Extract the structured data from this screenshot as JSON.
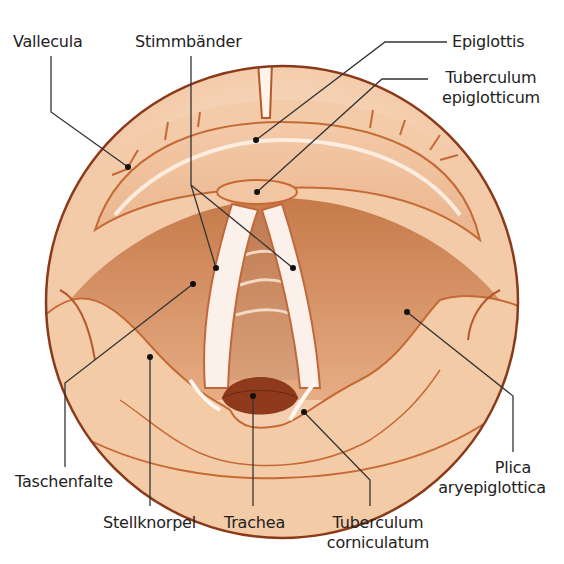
{
  "diagram": {
    "colors": {
      "background": "#ffffff",
      "tissue_light": "#f6d2b4",
      "tissue_mid": "#eab28a",
      "tissue_dark": "#c9733f",
      "outline": "#8a3a18",
      "cord_white": "#fbf1ea",
      "trachea_dark": "#8f3a1c",
      "leader_line": "#333333"
    },
    "labels": {
      "vallecula": "Vallecula",
      "stimmbaender": "Stimmbänder",
      "epiglottis": "Epiglottis",
      "tuberculum_epiglotticum_1": "Tuberculum",
      "tuberculum_epiglotticum_2": "epiglotticum",
      "taschenfalte": "Taschenfalte",
      "plica_1": "Plica",
      "plica_2": "aryepiglottica",
      "stellknorpel": "Stellknorpel",
      "trachea": "Trachea",
      "tuberculum_corniculatum_1": "Tuberculum",
      "tuberculum_corniculatum_2": "corniculatum"
    }
  }
}
